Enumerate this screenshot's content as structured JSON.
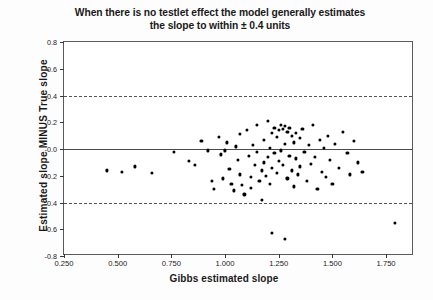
{
  "chart_data": {
    "type": "scatter",
    "title": "When there is no testlet effect the model generally estimates the slope to within  ± 0.4 units",
    "title_lines": [
      "When there is no testlet effect the model generally estimates",
      "the slope to within  ± 0.4 units"
    ],
    "xlabel": "Gibbs estimated slope",
    "ylabel": "Estimated slope MINUS True slope",
    "xlim": [
      0.25,
      1.88
    ],
    "ylim": [
      -0.8,
      0.8
    ],
    "xticks": [
      0.25,
      0.5,
      0.75,
      1.0,
      1.25,
      1.5,
      1.75
    ],
    "xtick_labels": [
      "0.250",
      "0.500",
      "0.750",
      "1.000",
      "1.250",
      "1.500",
      "1.750"
    ],
    "yticks": [
      0.8,
      0.6,
      0.4,
      0.2,
      -0.0,
      -0.2,
      -0.4,
      -0.6,
      -0.8
    ],
    "ytick_labels": [
      "0.8",
      "0.6",
      "0.4",
      "0.2",
      "-0.0",
      "-0.2",
      "-0.4",
      "-0.6",
      "-0.8"
    ],
    "grid": false,
    "legend": null,
    "reference_lines": [
      {
        "name": "upper-tolerance-line",
        "y": 0.4,
        "style": "dashed"
      },
      {
        "name": "zero-line",
        "y": 0.0,
        "style": "solid"
      },
      {
        "name": "lower-tolerance-line",
        "y": -0.4,
        "style": "dashed"
      }
    ],
    "marker": {
      "shape": "circle",
      "color": "#000000",
      "size": 3.2
    },
    "point_count": 96,
    "x": [
      0.45,
      0.52,
      0.58,
      0.66,
      0.76,
      0.83,
      0.86,
      0.89,
      0.92,
      0.94,
      0.95,
      0.97,
      0.98,
      0.99,
      1.0,
      1.01,
      1.02,
      1.03,
      1.04,
      1.05,
      1.06,
      1.07,
      1.07,
      1.08,
      1.09,
      1.1,
      1.11,
      1.12,
      1.12,
      1.13,
      1.14,
      1.15,
      1.15,
      1.16,
      1.17,
      1.17,
      1.18,
      1.18,
      1.19,
      1.2,
      1.2,
      1.21,
      1.21,
      1.22,
      1.22,
      1.23,
      1.23,
      1.24,
      1.24,
      1.25,
      1.25,
      1.26,
      1.26,
      1.27,
      1.27,
      1.28,
      1.28,
      1.29,
      1.29,
      1.3,
      1.3,
      1.31,
      1.31,
      1.32,
      1.32,
      1.33,
      1.33,
      1.34,
      1.35,
      1.35,
      1.36,
      1.37,
      1.38,
      1.39,
      1.4,
      1.41,
      1.42,
      1.43,
      1.44,
      1.45,
      1.46,
      1.47,
      1.48,
      1.49,
      1.5,
      1.51,
      1.53,
      1.55,
      1.57,
      1.58,
      1.6,
      1.62,
      1.64,
      1.22,
      1.28,
      1.79
    ],
    "y": [
      -0.16,
      -0.17,
      -0.13,
      -0.18,
      -0.02,
      -0.09,
      -0.12,
      0.06,
      -0.01,
      -0.24,
      -0.3,
      0.09,
      -0.04,
      -0.22,
      -0.01,
      0.05,
      -0.15,
      -0.26,
      -0.31,
      0.02,
      -0.08,
      0.11,
      -0.19,
      -0.27,
      -0.34,
      0.14,
      -0.05,
      -0.21,
      -0.29,
      0.03,
      -0.12,
      0.18,
      -0.02,
      -0.24,
      -0.16,
      -0.38,
      0.07,
      -0.1,
      -0.2,
      0.21,
      -0.06,
      0.01,
      -0.26,
      0.12,
      -0.14,
      0.16,
      -0.03,
      0.09,
      -0.18,
      0.14,
      -0.09,
      0.18,
      -0.01,
      0.15,
      -0.12,
      0.17,
      0.04,
      0.13,
      -0.22,
      0.16,
      -0.05,
      0.1,
      -0.16,
      0.05,
      -0.28,
      0.12,
      -0.07,
      -0.19,
      0.08,
      -0.13,
      0.15,
      -0.02,
      -0.24,
      0.03,
      -0.11,
      0.18,
      -0.06,
      -0.3,
      0.07,
      -0.17,
      0.01,
      -0.21,
      0.1,
      -0.08,
      -0.26,
      0.04,
      -0.14,
      0.13,
      -0.03,
      -0.19,
      0.06,
      -0.1,
      -0.17,
      -0.63,
      -0.67,
      -0.55
    ]
  }
}
